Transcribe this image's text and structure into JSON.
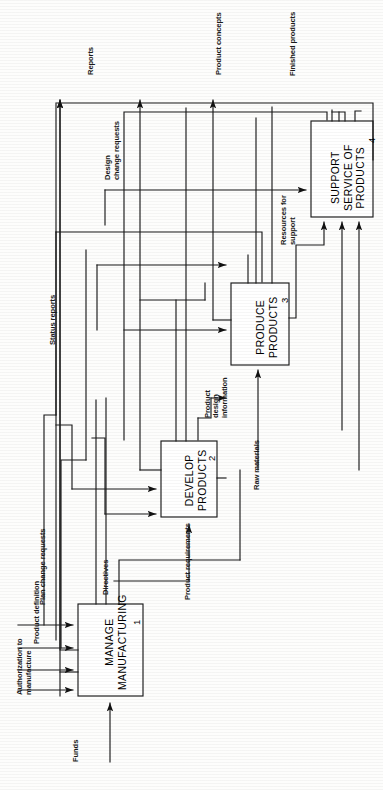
{
  "diagram": {
    "type": "idef0-activity-diagram",
    "orientation": "rotated-90-counterclockwise",
    "boxes": [
      {
        "id": "A1",
        "number": "1",
        "line1": "MANAGE",
        "line2": "MANUFACTURING"
      },
      {
        "id": "A2",
        "number": "2",
        "line1": "DEVELOP",
        "line2": "PRODUCTS"
      },
      {
        "id": "A3",
        "number": "3",
        "line1": "PRODUCE",
        "line2": "PRODUCTS"
      },
      {
        "id": "A4",
        "number": "4",
        "line1": "SUPPORT",
        "line2": "SERVICE OF",
        "line3": "PRODUCTS"
      }
    ],
    "flows": [
      {
        "id": "f-reports",
        "label": "Reports",
        "kind": "output"
      },
      {
        "id": "f-product-concepts",
        "label": "Product concepts",
        "kind": "output"
      },
      {
        "id": "f-finished-products",
        "label": "Finished products",
        "kind": "output"
      },
      {
        "id": "f-design-change",
        "label": "Design\nchange requests",
        "line1": "Design",
        "line2": "change requests",
        "kind": "feedback"
      },
      {
        "id": "f-status-reports",
        "label": "Status reports",
        "kind": "feedback"
      },
      {
        "id": "f-resources-support",
        "label": "Resources for\nsupport",
        "line1": "Resources for",
        "line2": "support",
        "kind": "mechanism"
      },
      {
        "id": "f-product-design-info",
        "label": "Product\ndesign\ninformation",
        "line1": "Product",
        "line2": "design",
        "line3": "information",
        "kind": "internal"
      },
      {
        "id": "f-raw-materials",
        "label": "Raw materials",
        "kind": "input"
      },
      {
        "id": "f-product-requirements",
        "label": "Product requirements",
        "kind": "internal"
      },
      {
        "id": "f-directives",
        "label": "Directives",
        "kind": "control"
      },
      {
        "id": "f-plan-change",
        "label": "Plan change requests",
        "kind": "feedback"
      },
      {
        "id": "f-product-definition",
        "label": "Product definition",
        "kind": "input"
      },
      {
        "id": "f-authorization",
        "label": "Authorization to\nmanufacture",
        "line1": "Authorization to",
        "line2": "manufacture",
        "kind": "input"
      },
      {
        "id": "f-funds",
        "label": "Funds",
        "kind": "mechanism"
      }
    ],
    "colors": {
      "line": "#1a1a1a",
      "box_fill": "#ffffff",
      "text": "#000000",
      "background": "#fdfdfc"
    }
  }
}
